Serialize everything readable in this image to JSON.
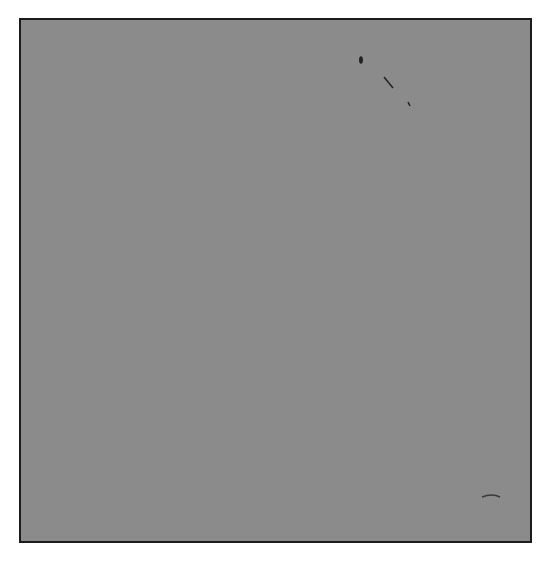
{
  "figure": {
    "axes": {
      "x_label": "x",
      "y_label": "y",
      "origin_label": "O",
      "x_range": [
        -8,
        11
      ],
      "y_range": [
        -9,
        10
      ],
      "grid": true
    },
    "colors": {
      "grid_fill": "#8b8b8b",
      "grid_lines": "#1c1c1c",
      "points": "#0d0d0d",
      "background": "#ffffff"
    },
    "points": [
      {
        "label": "A",
        "x": 8,
        "y": 2
      },
      {
        "label": "B",
        "x": 2,
        "y": 8
      },
      {
        "label": "C",
        "x": 6,
        "y": 0
      },
      {
        "label": "D",
        "x": 0,
        "y": 6
      },
      {
        "label": "E",
        "x": -5,
        "y": 7
      },
      {
        "label": "F",
        "x": -7,
        "y": 0
      },
      {
        "label": "G",
        "x": -6,
        "y": -5
      },
      {
        "label": "H",
        "x": 0,
        "y": -4
      },
      {
        "label": "I",
        "x": 3,
        "y": -6
      },
      {
        "label": "J",
        "x": 9,
        "y": -1
      }
    ]
  },
  "chart_data": {
    "type": "scatter",
    "title": "",
    "xlabel": "x",
    "ylabel": "y",
    "xlim": [
      -8,
      11
    ],
    "ylim": [
      -9,
      10
    ],
    "grid": true,
    "legend": "none",
    "annotations": [
      "O",
      "A",
      "B",
      "C",
      "D",
      "E",
      "F",
      "G",
      "H",
      "I",
      "J"
    ],
    "series": [
      {
        "name": "points",
        "labels": [
          "A",
          "B",
          "C",
          "D",
          "E",
          "F",
          "G",
          "H",
          "I",
          "J"
        ],
        "x": [
          8,
          2,
          6,
          0,
          -5,
          -7,
          -6,
          0,
          3,
          9
        ],
        "y": [
          2,
          8,
          0,
          6,
          7,
          0,
          -5,
          -4,
          -6,
          -1
        ]
      }
    ]
  }
}
